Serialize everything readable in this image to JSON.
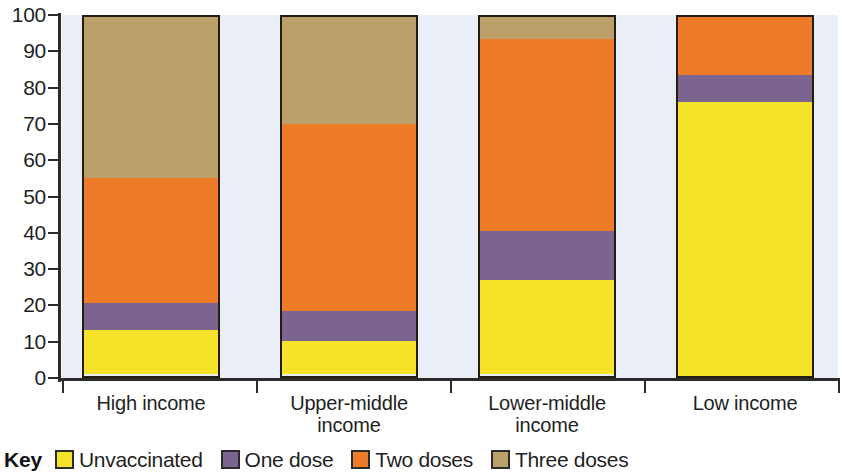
{
  "chart_data": {
    "type": "bar",
    "subtype": "stacked-bar-100",
    "title": "",
    "xlabel": "",
    "ylabel": "",
    "ylim": [
      0,
      100
    ],
    "grid": false,
    "legend_position": "bottom-left",
    "legend_title": "Key",
    "categories": [
      "High income",
      "Upper-middle income",
      "Lower-middle income",
      "Low income"
    ],
    "category_lines": [
      [
        "High income"
      ],
      [
        "Upper-middle",
        "income"
      ],
      [
        "Lower-middle",
        "income"
      ],
      [
        "Low income"
      ]
    ],
    "ytick_labels": [
      "100",
      "90",
      "80",
      "70",
      "60",
      "50",
      "40",
      "30",
      "20",
      "10",
      "0"
    ],
    "ytick_values": [
      100,
      90,
      80,
      70,
      60,
      50,
      40,
      30,
      20,
      10,
      0
    ],
    "series": [
      {
        "name": "Unvaccinated",
        "color": "#F5E32A",
        "values": [
          12,
          9,
          26,
          75.5
        ],
        "cumulative_tops": [
          12,
          9,
          26,
          75.5
        ]
      },
      {
        "name": "One dose",
        "color": "#7B6490",
        "values": [
          8,
          9,
          14,
          8
        ],
        "cumulative_tops": [
          20,
          18,
          40,
          83.5
        ]
      },
      {
        "name": "Two doses",
        "color": "#EE7B28",
        "values": [
          35,
          52,
          53.5,
          16.5
        ],
        "cumulative_tops": [
          55,
          70,
          93.5,
          100
        ]
      },
      {
        "name": "Three doses",
        "color": "#BBA06A",
        "values": [
          45,
          30,
          6.5,
          0
        ],
        "cumulative_tops": [
          100,
          100,
          100,
          100
        ]
      }
    ]
  },
  "legend": {
    "key_word": "Key",
    "items": [
      {
        "label": "Unvaccinated",
        "color": "#F5E32A"
      },
      {
        "label": "One dose",
        "color": "#7B6490"
      },
      {
        "label": "Two doses",
        "color": "#EE7B28"
      },
      {
        "label": "Three doses",
        "color": "#BBA06A"
      }
    ]
  },
  "colors": {
    "unvaccinated": "#F5E32A",
    "one_dose": "#7B6490",
    "two_doses": "#EE7B28",
    "three_doses": "#BBA06A",
    "axis": "#2b2b2b",
    "plot_background": "#e9eef7",
    "bar_outline": "#241c10"
  }
}
